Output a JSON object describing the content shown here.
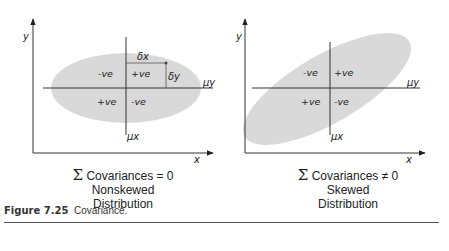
{
  "diagrams": [
    {
      "id": "nonskewed",
      "axis_x": "x",
      "axis_y": "y",
      "mean_x": "μx",
      "mean_y": "μy",
      "delta_x": "δx",
      "delta_y": "δy",
      "quadrants": {
        "top_left": "-ve",
        "top_right": "+ve",
        "bottom_left": "+ve",
        "bottom_right": "-ve"
      },
      "caption": {
        "sigma": "Σ",
        "line1": "Covariances = 0",
        "line2": "Nonskewed",
        "line3": "Distribution"
      }
    },
    {
      "id": "skewed",
      "axis_x": "x",
      "axis_y": "y",
      "mean_x": "μx",
      "mean_y": "μy",
      "quadrants": {
        "top_left": "-ve",
        "top_right": "+ve",
        "bottom_left": "+ve",
        "bottom_right": "-ve"
      },
      "caption": {
        "sigma": "Σ",
        "line1": "Covariances ≠ 0",
        "line2": "Skewed",
        "line3": "Distribution"
      }
    }
  ],
  "figure": {
    "number": "Figure 7.25",
    "title": "Covariance."
  },
  "colors": {
    "ellipse": "#d9d9d9",
    "line": "#333333"
  }
}
